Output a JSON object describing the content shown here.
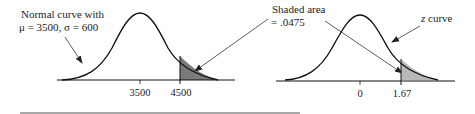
{
  "left_panel": {
    "label_line1": "Normal curve with",
    "label_line2": "μ = 3500, σ = 600",
    "ticks": [
      "3500",
      "4500"
    ],
    "shade_color": "#7a7a7a"
  },
  "right_panel": {
    "curve_label": "z curve",
    "ticks": [
      "0",
      "1.67"
    ],
    "shade_color": "#b8b8b8"
  },
  "shared_annotation": {
    "line1": "Shaded area",
    "line2": "= .0475"
  },
  "colors": {
    "line": "#111111",
    "arrow": "#333333",
    "rule": "#555555"
  }
}
